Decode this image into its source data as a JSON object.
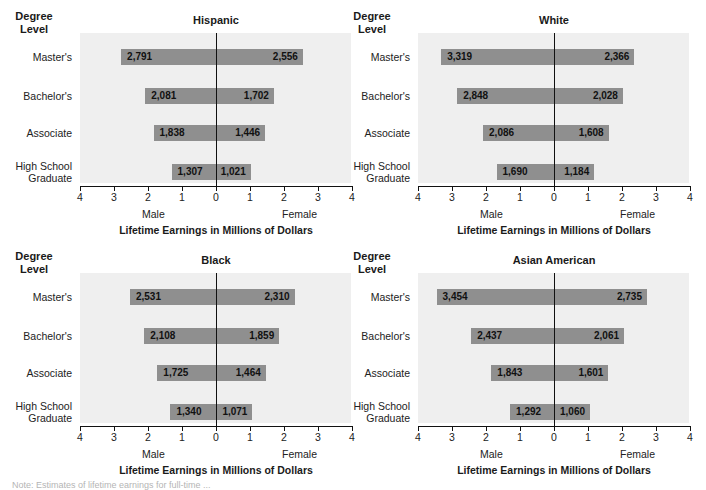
{
  "chart_data": [
    {
      "type": "bar",
      "orientation": "horizontal-diverging",
      "title": "Hispanic",
      "categories": [
        "Master's",
        "Bachelor's",
        "Associate",
        "High School Graduate"
      ],
      "series": [
        {
          "name": "Male",
          "values": [
            2791,
            2081,
            1838,
            1307
          ],
          "labels": [
            "2,791",
            "2,081",
            "1,838",
            "1,307"
          ]
        },
        {
          "name": "Female",
          "values": [
            2556,
            1702,
            1446,
            1021
          ],
          "labels": [
            "2,556",
            "1,702",
            "1,446",
            "1,021"
          ]
        }
      ],
      "unit": "thousands of dollars (axis in millions)",
      "xlabel": "Lifetime Earnings in Millions of Dollars",
      "ylabel": "Degree Level",
      "xticks": [
        "4",
        "3",
        "2",
        "1",
        "0",
        "1",
        "2",
        "3",
        "4"
      ],
      "xlim": [
        -4,
        4
      ],
      "side_labels": {
        "left": "Male",
        "right": "Female"
      },
      "grid": false
    },
    {
      "type": "bar",
      "orientation": "horizontal-diverging",
      "title": "White",
      "categories": [
        "Master's",
        "Bachelor's",
        "Associate",
        "High School Graduate"
      ],
      "series": [
        {
          "name": "Male",
          "values": [
            3319,
            2848,
            2086,
            1690
          ],
          "labels": [
            "3,319",
            "2,848",
            "2,086",
            "1,690"
          ]
        },
        {
          "name": "Female",
          "values": [
            2366,
            2028,
            1608,
            1184
          ],
          "labels": [
            "2,366",
            "2,028",
            "1,608",
            "1,184"
          ]
        }
      ],
      "unit": "thousands of dollars (axis in millions)",
      "xlabel": "Lifetime Earnings in Millions of Dollars",
      "ylabel": "Degree Level",
      "xticks": [
        "4",
        "3",
        "2",
        "1",
        "0",
        "1",
        "2",
        "3",
        "4"
      ],
      "xlim": [
        -4,
        4
      ],
      "side_labels": {
        "left": "Male",
        "right": "Female"
      },
      "grid": false
    },
    {
      "type": "bar",
      "orientation": "horizontal-diverging",
      "title": "Black",
      "categories": [
        "Master's",
        "Bachelor's",
        "Associate",
        "High School Graduate"
      ],
      "series": [
        {
          "name": "Male",
          "values": [
            2531,
            2108,
            1725,
            1340
          ],
          "labels": [
            "2,531",
            "2,108",
            "1,725",
            "1,340"
          ]
        },
        {
          "name": "Female",
          "values": [
            2310,
            1859,
            1464,
            1071
          ],
          "labels": [
            "2,310",
            "1,859",
            "1,464",
            "1,071"
          ]
        }
      ],
      "unit": "thousands of dollars (axis in millions)",
      "xlabel": "Lifetime Earnings in Millions of Dollars",
      "ylabel": "Degree Level",
      "xticks": [
        "4",
        "3",
        "2",
        "1",
        "0",
        "1",
        "2",
        "3",
        "4"
      ],
      "xlim": [
        -4,
        4
      ],
      "side_labels": {
        "left": "Male",
        "right": "Female"
      },
      "grid": false
    },
    {
      "type": "bar",
      "orientation": "horizontal-diverging",
      "title": "Asian American",
      "categories": [
        "Master's",
        "Bachelor's",
        "Associate",
        "High School Graduate"
      ],
      "series": [
        {
          "name": "Male",
          "values": [
            3454,
            2437,
            1843,
            1292
          ],
          "labels": [
            "3,454",
            "2,437",
            "1,843",
            "1,292"
          ]
        },
        {
          "name": "Female",
          "values": [
            2735,
            2061,
            1601,
            1060
          ],
          "labels": [
            "2,735",
            "2,061",
            "1,601",
            "1,060"
          ]
        }
      ],
      "unit": "thousands of dollars (axis in millions)",
      "xlabel": "Lifetime Earnings in Millions of Dollars",
      "ylabel": "Degree Level",
      "xticks": [
        "4",
        "3",
        "2",
        "1",
        "0",
        "1",
        "2",
        "3",
        "4"
      ],
      "xlim": [
        -4,
        4
      ],
      "side_labels": {
        "left": "Male",
        "right": "Female"
      },
      "grid": false
    }
  ],
  "labels": {
    "degree_header": [
      "Degree",
      "Level"
    ],
    "categories_display": [
      [
        "Master's"
      ],
      [
        "Bachelor's"
      ],
      [
        "Associate"
      ],
      [
        "High School",
        "Graduate"
      ]
    ],
    "male": "Male",
    "female": "Female",
    "xlabel": "Lifetime Earnings in Millions of Dollars"
  },
  "colors": {
    "bar": "#8f8f8f",
    "plot_bg": "#efefef",
    "axis": "#111111"
  },
  "note_partial": "Note: Estimates of lifetime earnings for full-time ..."
}
